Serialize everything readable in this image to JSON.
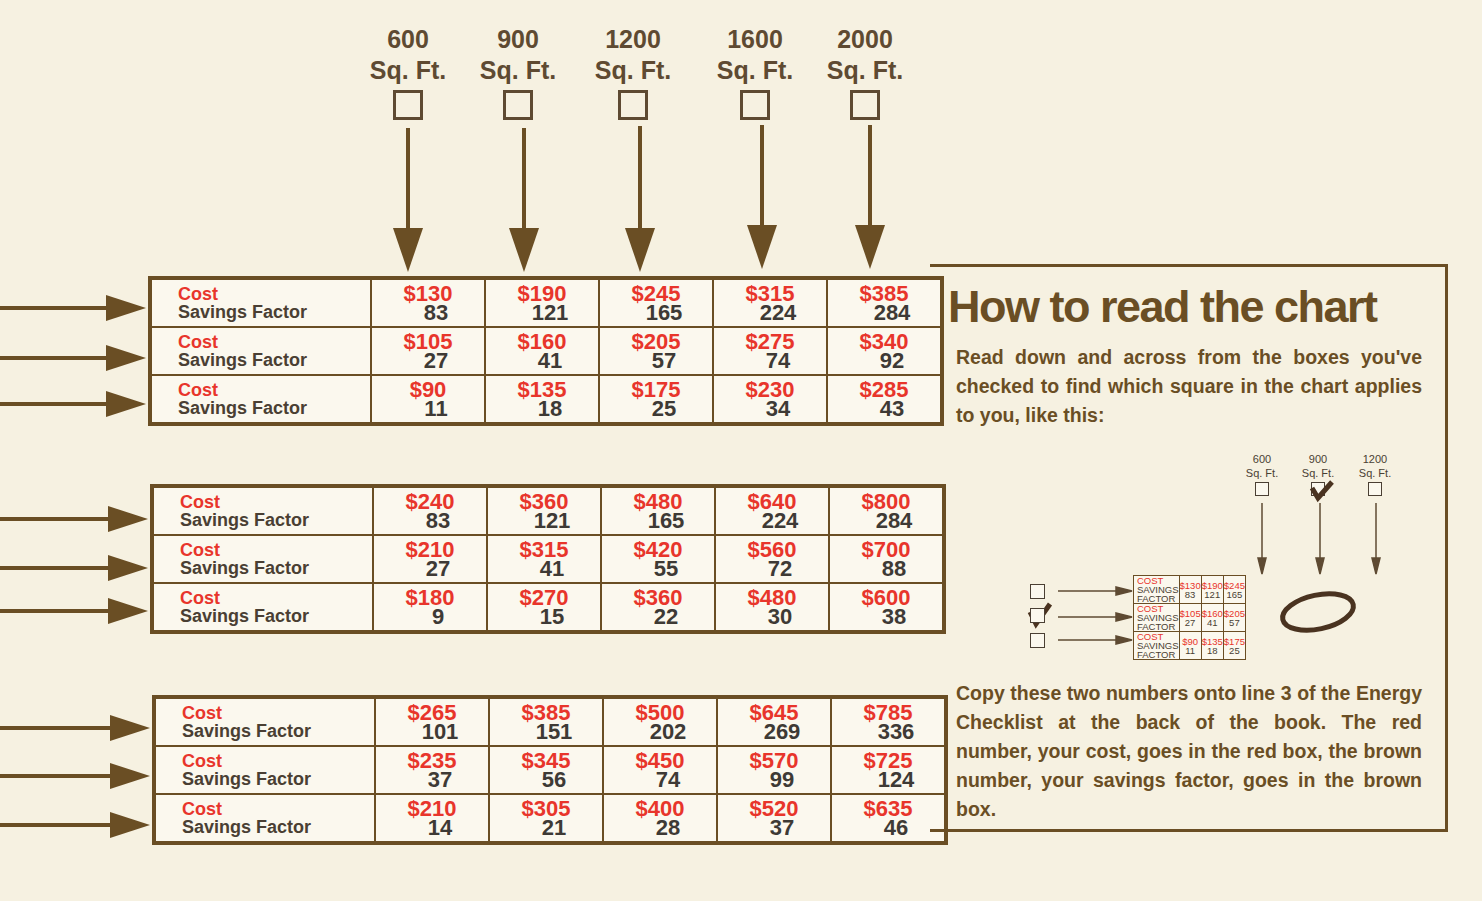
{
  "columns": [
    {
      "size": "600",
      "unit": "Sq. Ft."
    },
    {
      "size": "900",
      "unit": "Sq. Ft."
    },
    {
      "size": "1200",
      "unit": "Sq. Ft."
    },
    {
      "size": "1600",
      "unit": "Sq. Ft."
    },
    {
      "size": "2000",
      "unit": "Sq. Ft."
    }
  ],
  "row_labels": {
    "cost": "Cost",
    "savings": "Savings Factor"
  },
  "tables": [
    {
      "rows": [
        {
          "costs": [
            "$130",
            "$190",
            "$245",
            "$315",
            "$385"
          ],
          "savings": [
            "83",
            "121",
            "165",
            "224",
            "284"
          ]
        },
        {
          "costs": [
            "$105",
            "$160",
            "$205",
            "$275",
            "$340"
          ],
          "savings": [
            "27",
            "41",
            "57",
            "74",
            "92"
          ]
        },
        {
          "costs": [
            "$90",
            "$135",
            "$175",
            "$230",
            "$285"
          ],
          "savings": [
            "11",
            "18",
            "25",
            "34",
            "43"
          ]
        }
      ]
    },
    {
      "rows": [
        {
          "costs": [
            "$240",
            "$360",
            "$480",
            "$640",
            "$800"
          ],
          "savings": [
            "83",
            "121",
            "165",
            "224",
            "284"
          ]
        },
        {
          "costs": [
            "$210",
            "$315",
            "$420",
            "$560",
            "$700"
          ],
          "savings": [
            "27",
            "41",
            "55",
            "72",
            "88"
          ]
        },
        {
          "costs": [
            "$180",
            "$270",
            "$360",
            "$480",
            "$600"
          ],
          "savings": [
            "9",
            "15",
            "22",
            "30",
            "38"
          ]
        }
      ]
    },
    {
      "rows": [
        {
          "costs": [
            "$265",
            "$385",
            "$500",
            "$645",
            "$785"
          ],
          "savings": [
            "101",
            "151",
            "202",
            "269",
            "336"
          ]
        },
        {
          "costs": [
            "$235",
            "$345",
            "$450",
            "$570",
            "$725"
          ],
          "savings": [
            "37",
            "56",
            "74",
            "99",
            "124"
          ]
        },
        {
          "costs": [
            "$210",
            "$305",
            "$400",
            "$520",
            "$635"
          ],
          "savings": [
            "14",
            "21",
            "28",
            "37",
            "46"
          ]
        }
      ]
    }
  ],
  "panel": {
    "title": "How to read the chart",
    "intro": "Read down and across from the boxes you've checked to find which square in the chart applies to you, like this:",
    "outro": "Copy these two numbers onto line 3 of the Energy Checklist at the back of the book. The red number, your cost, goes in the red box, the brown number, your savings factor, goes in the brown box."
  },
  "example": {
    "columns": [
      {
        "size": "600",
        "unit": "Sq. Ft.",
        "checked": false
      },
      {
        "size": "900",
        "unit": "Sq. Ft.",
        "checked": true
      },
      {
        "size": "1200",
        "unit": "Sq. Ft.",
        "checked": false
      }
    ],
    "row_labels": {
      "cost": "COST",
      "savings": "SAVINGS FACTOR"
    },
    "rows": [
      {
        "checked": false,
        "costs": [
          "$130",
          "$190",
          "$245"
        ],
        "savings": [
          "83",
          "121",
          "165"
        ]
      },
      {
        "checked": true,
        "costs": [
          "$105",
          "$160",
          "$205"
        ],
        "savings": [
          "27",
          "41",
          "57"
        ]
      },
      {
        "checked": false,
        "costs": [
          "$90",
          "$135",
          "$175"
        ],
        "savings": [
          "11",
          "18",
          "25"
        ]
      }
    ],
    "circled": {
      "cost": "$160",
      "savings": "41"
    }
  },
  "colors": {
    "brown": "#6a4e24",
    "red": "#e8352b",
    "paper": "#f6f1e1"
  }
}
